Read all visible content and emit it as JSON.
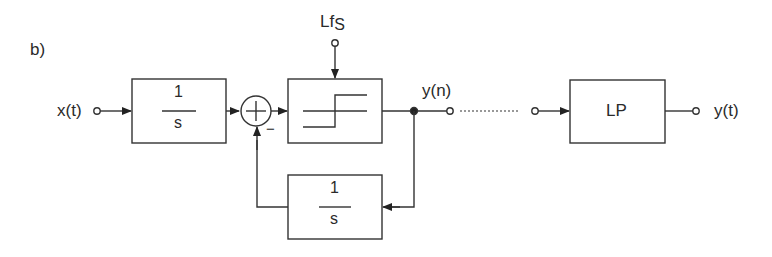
{
  "figure": {
    "panel_label": "b)",
    "input_label": "x(t)",
    "output_label": "y(t)",
    "intermediate_label": "y(n)",
    "clock_label_main": "Lf",
    "clock_label_sub": "S",
    "minus_sign": "−",
    "integrator_forward": {
      "numerator": "1",
      "denominator": "s"
    },
    "integrator_feedback": {
      "numerator": "1",
      "denominator": "s"
    },
    "lowpass_label": "LP",
    "colors": {
      "stroke": "#333333",
      "text": "#2a2a2a",
      "background": "#ffffff"
    }
  }
}
